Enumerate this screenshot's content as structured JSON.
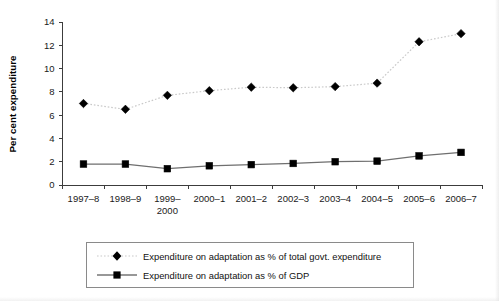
{
  "chart_data": {
    "type": "line",
    "title": "",
    "subtitle": "",
    "xlabel": "",
    "ylabel": "Per cent expenditure",
    "categories": [
      "1997–8",
      "1998–9",
      "1999–\n2000",
      "2000–1",
      "2001–2",
      "2002–3",
      "2003–4",
      "2004–5",
      "2005–6",
      "2006–7"
    ],
    "categories_display": [
      {
        "line1": "1997–8",
        "line2": ""
      },
      {
        "line1": "1998–9",
        "line2": ""
      },
      {
        "line1": "1999–",
        "line2": "2000"
      },
      {
        "line1": "2000–1",
        "line2": ""
      },
      {
        "line1": "2001–2",
        "line2": ""
      },
      {
        "line1": "2002–3",
        "line2": ""
      },
      {
        "line1": "2003–4",
        "line2": ""
      },
      {
        "line1": "2004–5",
        "line2": ""
      },
      {
        "line1": "2005–6",
        "line2": ""
      },
      {
        "line1": "2006–7",
        "line2": ""
      }
    ],
    "ylim": [
      0,
      14
    ],
    "yticks": [
      0,
      2,
      4,
      6,
      8,
      10,
      12,
      14
    ],
    "ytick_labels": [
      "0",
      "2",
      "4",
      "6",
      "8",
      "10",
      "12",
      "14"
    ],
    "grid": false,
    "legend_position": "bottom",
    "series": [
      {
        "name": "Expenditure on adaptation as % of total govt. expenditure",
        "marker": "diamond",
        "line_style": "dotted",
        "color": "#000000",
        "line_color": "#c9c9c9",
        "values": [
          7.0,
          6.5,
          7.7,
          8.1,
          8.4,
          8.35,
          8.45,
          8.75,
          12.3,
          13.0
        ]
      },
      {
        "name": "Expenditure on adaptation as % of GDP",
        "marker": "square",
        "line_style": "solid",
        "color": "#000000",
        "line_color": "#6f6f6f",
        "values": [
          1.8,
          1.8,
          1.4,
          1.65,
          1.75,
          1.85,
          2.0,
          2.05,
          2.5,
          2.8
        ]
      }
    ]
  },
  "axis": {
    "y_title": "Per cent expenditure"
  },
  "legend": {
    "items": [
      {
        "label": "Expenditure on adaptation as % of total govt. expenditure",
        "marker": "diamond",
        "line_style": "dotted"
      },
      {
        "label": "Expenditure on adaptation as % of GDP",
        "marker": "square",
        "line_style": "solid"
      }
    ]
  }
}
